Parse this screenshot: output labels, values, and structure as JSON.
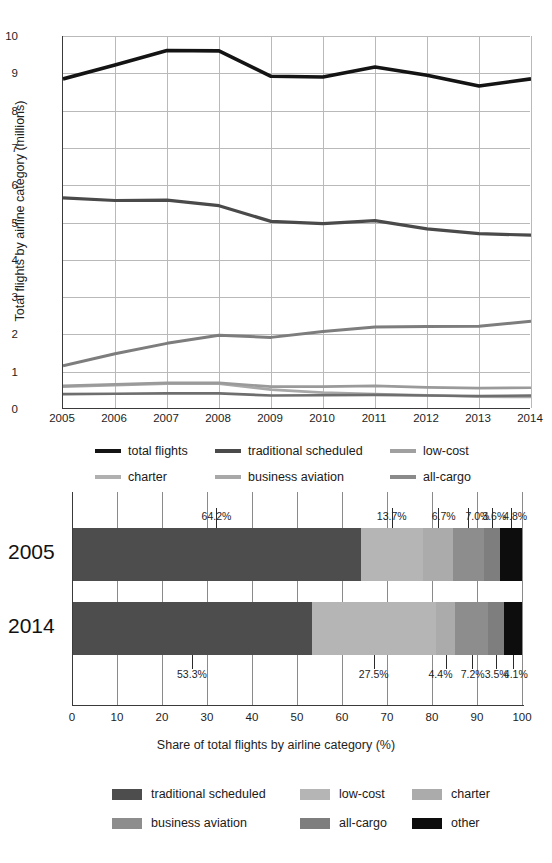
{
  "chart_data": [
    {
      "type": "line",
      "title": "",
      "xlabel": "",
      "ylabel": "Total flights by airline category (millions)",
      "x": [
        2005,
        2006,
        2007,
        2008,
        2009,
        2010,
        2011,
        2012,
        2013,
        2014
      ],
      "xticklabels": [
        "2005",
        "2006",
        "2007",
        "2008",
        "2009",
        "2010",
        "2011",
        "2012",
        "2013",
        "2014"
      ],
      "yticklabels": [
        "0",
        "1",
        "2",
        "3",
        "4",
        "5",
        "6",
        "7",
        "8",
        "9",
        "10"
      ],
      "ylim": [
        0,
        10
      ],
      "grid": true,
      "legend_position": "below",
      "series": [
        {
          "name": "total flights",
          "color": "#141414",
          "width": 3.6,
          "values": [
            8.85,
            9.22,
            9.61,
            9.6,
            8.92,
            8.9,
            9.17,
            8.95,
            8.66,
            8.85
          ]
        },
        {
          "name": "traditional scheduled",
          "color": "#4a4a4a",
          "width": 3.2,
          "values": [
            5.66,
            5.59,
            5.6,
            5.45,
            5.03,
            4.97,
            5.05,
            4.83,
            4.7,
            4.66
          ]
        },
        {
          "name": "low-cost",
          "color": "#7d7d7d",
          "width": 3.0,
          "values": [
            1.16,
            1.48,
            1.76,
            1.98,
            1.92,
            2.08,
            2.2,
            2.21,
            2.22,
            2.35
          ]
        },
        {
          "name": "charter",
          "color": "#a8a8a8",
          "width": 2.6,
          "values": [
            0.6,
            0.64,
            0.68,
            0.68,
            0.52,
            0.44,
            0.4,
            0.37,
            0.33,
            0.32
          ]
        },
        {
          "name": "business aviation",
          "color": "#9a9a9a",
          "width": 2.6,
          "values": [
            0.62,
            0.66,
            0.7,
            0.7,
            0.6,
            0.6,
            0.62,
            0.58,
            0.56,
            0.57
          ]
        },
        {
          "name": "all-cargo",
          "color": "#6e6e6e",
          "width": 2.6,
          "values": [
            0.4,
            0.41,
            0.42,
            0.42,
            0.36,
            0.37,
            0.38,
            0.36,
            0.35,
            0.36
          ]
        }
      ],
      "legend": [
        {
          "label": "total flights",
          "color": "#141414"
        },
        {
          "label": "traditional scheduled",
          "color": "#4a4a4a"
        },
        {
          "label": "low-cost",
          "color": "#a0a0a0"
        },
        {
          "label": "charter",
          "color": "#b0b0b0"
        },
        {
          "label": "business aviation",
          "color": "#a8a8a8"
        },
        {
          "label": "all-cargo",
          "color": "#8a8a8a"
        }
      ]
    },
    {
      "type": "bar",
      "orientation": "horizontal",
      "stacked": true,
      "title": "",
      "xlabel": "Share of total flights by airline category (%)",
      "ylabel": "",
      "categories": [
        "2005",
        "2014"
      ],
      "xticklabels": [
        "0",
        "10",
        "20",
        "30",
        "40",
        "50",
        "60",
        "70",
        "80",
        "90",
        "100"
      ],
      "xlim": [
        0,
        100
      ],
      "grid": true,
      "legend_position": "below",
      "series": [
        {
          "name": "traditional scheduled",
          "color": "#4d4d4d",
          "values": [
            64.2,
            53.3
          ],
          "labels": [
            "64.2%",
            "53.3%"
          ]
        },
        {
          "name": "low-cost",
          "color": "#b5b5b5",
          "values": [
            13.7,
            27.5
          ],
          "labels": [
            "13.7%",
            "27.5%"
          ]
        },
        {
          "name": "charter",
          "color": "#ababab",
          "values": [
            6.7,
            4.4
          ],
          "labels": [
            "6.7%",
            "4.4%"
          ]
        },
        {
          "name": "business aviation",
          "color": "#8d8d8d",
          "values": [
            7.0,
            7.2
          ],
          "labels": [
            "7.0%",
            "7.2%"
          ]
        },
        {
          "name": "all-cargo",
          "color": "#7e7e7e",
          "values": [
            3.6,
            3.5
          ],
          "labels": [
            "3.6%",
            "3.5%"
          ]
        },
        {
          "name": "other",
          "color": "#0d0d0d",
          "values": [
            4.8,
            4.1
          ],
          "labels": [
            "4.8%",
            "4.1%"
          ]
        }
      ],
      "legend": [
        {
          "label": "traditional scheduled",
          "color": "#4d4d4d"
        },
        {
          "label": "low-cost",
          "color": "#b5b5b5"
        },
        {
          "label": "charter",
          "color": "#ababab"
        },
        {
          "label": "business aviation",
          "color": "#8d8d8d"
        },
        {
          "label": "all-cargo",
          "color": "#7e7e7e"
        },
        {
          "label": "other",
          "color": "#0d0d0d"
        }
      ]
    }
  ]
}
